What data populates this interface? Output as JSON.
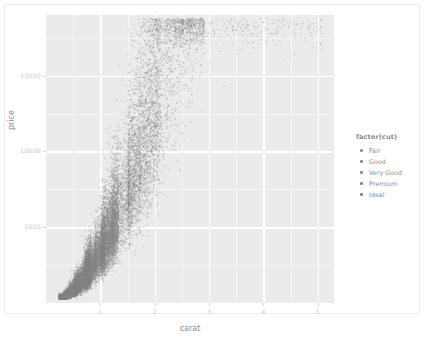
{
  "chart_data": {
    "type": "scatter",
    "title": "",
    "xlabel": "carat",
    "ylabel": "price",
    "xlim": [
      0,
      5.3
    ],
    "ylim": [
      0,
      19000
    ],
    "grid": true,
    "legend_position": "right",
    "legend_title": "factor(cut)",
    "x_ticks": [
      {
        "value": 1,
        "label": "1"
      },
      {
        "value": 2,
        "label": "2"
      },
      {
        "value": 3,
        "label": "3"
      },
      {
        "value": 4,
        "label": "4"
      },
      {
        "value": 5,
        "label": "5"
      }
    ],
    "y_ticks": [
      {
        "value": 5000,
        "label": "5000"
      },
      {
        "value": 10000,
        "label": "10000"
      },
      {
        "value": 15000,
        "label": "15000"
      }
    ],
    "series": [
      {
        "name": "Fair",
        "color": "#8f8f8f",
        "marker": "dot"
      },
      {
        "name": "Good",
        "color": "#8a8a8a",
        "marker": "dot"
      },
      {
        "name": "Very Good",
        "color": "#878787",
        "marker": "dot"
      },
      {
        "name": "Premium",
        "color": "#858585",
        "marker": "dot"
      },
      {
        "name": "Ideal",
        "color": "#828282",
        "marker": "dot"
      }
    ],
    "n_points_approx": 53940,
    "colors": {
      "panel_background": "#ebebeb",
      "grid_major": "#ffffff",
      "grid_minor": "#f5f5f5",
      "axis_text": "#c9c9c9",
      "axis_title": "#8d8d8d",
      "point": "#888888",
      "plot_background": "#ffffff"
    }
  },
  "axes": {
    "x_title": "carat",
    "y_title": "price"
  },
  "legend": {
    "title": "factor(cut)",
    "items": [
      {
        "label": "Fair"
      },
      {
        "label": "Good"
      },
      {
        "label": "Very Good"
      },
      {
        "label": "Premium"
      },
      {
        "label": "Ideal"
      }
    ]
  }
}
